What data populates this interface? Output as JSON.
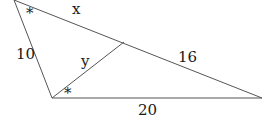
{
  "diagram": {
    "type": "triangle",
    "stroke_color": "#555555",
    "text_color": "#1a1a1a",
    "labels": {
      "side_top": "x",
      "side_left": "10",
      "cevian": "y",
      "side_right_segment": "16",
      "side_bottom": "20",
      "angle_top": "*",
      "angle_bottom_left": "*"
    }
  }
}
